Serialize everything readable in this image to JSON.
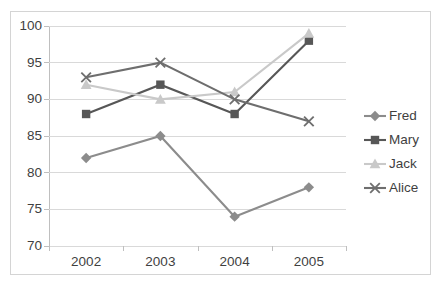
{
  "chart_data": {
    "type": "line",
    "title": "",
    "subtitle": "",
    "xlabel": "",
    "ylabel": "",
    "categories": [
      "2002",
      "2003",
      "2004",
      "2005"
    ],
    "series": [
      {
        "name": "Fred",
        "values": [
          82,
          85,
          74,
          78
        ],
        "color": "#8c8c8c",
        "marker": "diamond"
      },
      {
        "name": "Mary",
        "values": [
          88,
          92,
          88,
          98
        ],
        "color": "#575757",
        "marker": "square"
      },
      {
        "name": "Jack",
        "values": [
          92,
          90,
          91,
          99
        ],
        "color": "#c9c9c9",
        "marker": "triangle"
      },
      {
        "name": "Alice",
        "values": [
          93,
          95,
          90,
          87
        ],
        "color": "#6e6e6e",
        "marker": "x"
      }
    ],
    "ylim": [
      70,
      100
    ],
    "yticks": [
      70,
      75,
      80,
      85,
      90,
      95,
      100
    ],
    "ytick_labels": [
      "70",
      "75",
      "80",
      "85",
      "90",
      "95",
      "100"
    ],
    "xtick_labels": [
      "2002",
      "2003",
      "2004",
      "2005"
    ],
    "grid": "horizontal",
    "legend_position": "right",
    "legend_entries": [
      "Fred",
      "Mary",
      "Jack",
      "Alice"
    ],
    "border_color": "#d4d4d4",
    "gridline_color": "#d9d9d9",
    "axis_color": "#bfbfbf",
    "text_color": "#3f3f3f",
    "plot_background": "#ffffff"
  }
}
